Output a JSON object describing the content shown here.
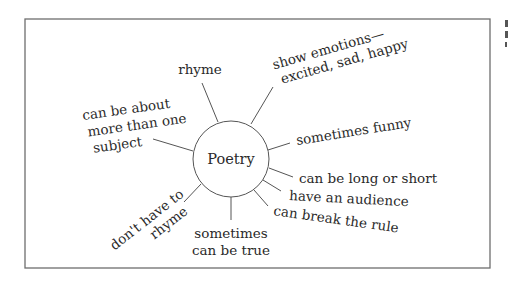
{
  "diagram": {
    "type": "concept-web",
    "center": "Poetry",
    "branches": [
      {
        "lines": [
          "rhyme"
        ]
      },
      {
        "lines": [
          "show emotions—",
          "excited, sad, happy"
        ]
      },
      {
        "lines": [
          "sometimes funny"
        ]
      },
      {
        "lines": [
          "can be long or short"
        ]
      },
      {
        "lines": [
          "have an audience"
        ]
      },
      {
        "lines": [
          "can break the rule"
        ]
      },
      {
        "lines": [
          "sometimes",
          "can be true"
        ]
      },
      {
        "lines": [
          "don't have to",
          "rhyme"
        ]
      },
      {
        "lines": [
          "can be about",
          "more than one",
          "subject"
        ]
      }
    ]
  }
}
